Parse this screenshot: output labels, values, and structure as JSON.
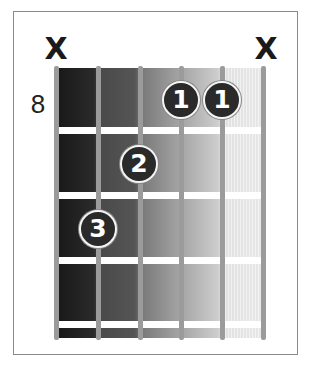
{
  "diagram": {
    "type": "guitar-chord-diagram",
    "starting_fret_label": "8",
    "strings": 6,
    "frets_shown": 4,
    "muted_marker": "X",
    "string_status": [
      "X",
      "",
      "",
      "",
      "",
      "X"
    ],
    "fingers": [
      {
        "finger": "1",
        "string": 4,
        "fret": 1
      },
      {
        "finger": "1",
        "string": 5,
        "fret": 1
      },
      {
        "finger": "2",
        "string": 3,
        "fret": 2
      },
      {
        "finger": "3",
        "string": 2,
        "fret": 3
      }
    ],
    "colors": {
      "frame_border": "#8a8a8a",
      "string": "#9b9b9b",
      "fret": "#ffffff",
      "dot_fill": "#2a2a2a",
      "dot_ring": "#f4f4f4",
      "gradient_left": "#181818",
      "gradient_right": "#eeeeee",
      "mute_mark": "#1a1a1a"
    }
  }
}
